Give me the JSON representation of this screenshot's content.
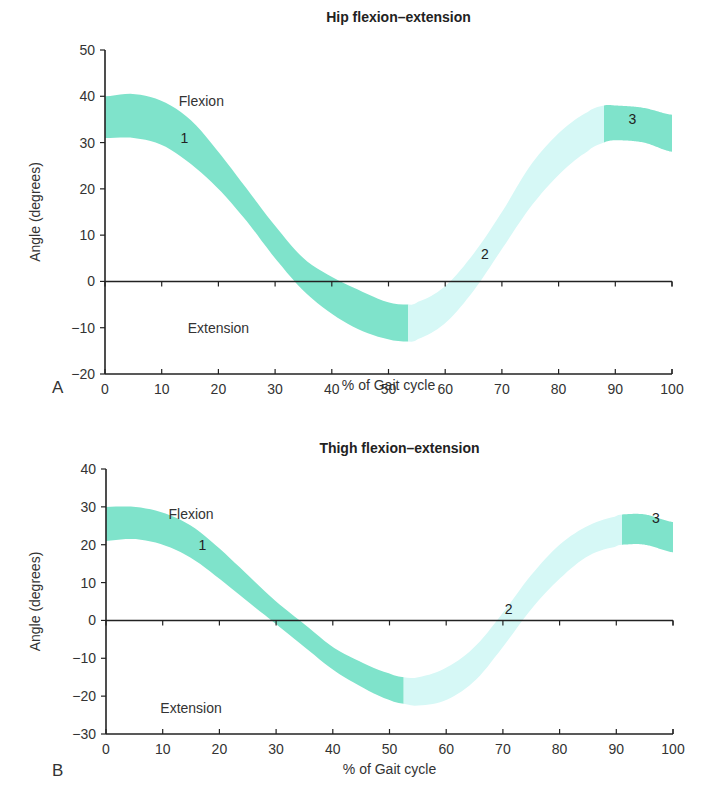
{
  "chart_data": [
    {
      "panel": "A",
      "type": "area",
      "title": "Hip flexion–extension",
      "xlabel": "% of Gait cycle",
      "ylabel": "Angle (degrees)",
      "xlim": [
        0,
        100
      ],
      "ylim": [
        -20,
        50
      ],
      "xticks": [
        0,
        10,
        20,
        30,
        40,
        50,
        60,
        70,
        80,
        90,
        100
      ],
      "yticks": [
        -20,
        -10,
        0,
        10,
        20,
        30,
        40,
        50
      ],
      "annotations": [
        {
          "text": "Flexion",
          "x": 17,
          "y": 39
        },
        {
          "text": "Extension",
          "x": 20,
          "y": -10
        },
        {
          "text": "1",
          "x": 14,
          "y": 31
        },
        {
          "text": "2",
          "x": 67,
          "y": 6
        },
        {
          "text": "3",
          "x": 93,
          "y": 35
        }
      ],
      "series": [
        {
          "name": "upper bound",
          "x": [
            0,
            5,
            10,
            15,
            20,
            25,
            30,
            35,
            40,
            45,
            50,
            53.5,
            55,
            60,
            65,
            70,
            75,
            80,
            85,
            88,
            90,
            95,
            100
          ],
          "values": [
            40,
            40.5,
            39,
            35,
            28,
            20,
            12,
            5,
            1,
            -2,
            -4.5,
            -5,
            -4.5,
            -1,
            6,
            15,
            25,
            32,
            36.5,
            38,
            38,
            37.5,
            36
          ]
        },
        {
          "name": "lower bound",
          "x": [
            0,
            5,
            10,
            15,
            20,
            25,
            30,
            35,
            40,
            45,
            50,
            53.5,
            55,
            60,
            65,
            70,
            75,
            80,
            85,
            88,
            90,
            95,
            100
          ],
          "values": [
            31,
            31,
            29.5,
            25.5,
            20,
            13,
            5,
            -2,
            -7,
            -10.5,
            -12.5,
            -13,
            -12.5,
            -9,
            -2,
            7,
            16,
            23,
            28,
            30,
            30.5,
            30,
            28
          ]
        }
      ],
      "segments": [
        {
          "label": "1",
          "from": 0,
          "to": 53.5,
          "color": "#7fe3cb"
        },
        {
          "label": "2",
          "from": 53.5,
          "to": 88,
          "color": "#d6f8f6"
        },
        {
          "label": "3",
          "from": 88,
          "to": 100,
          "color": "#7fe3cb"
        }
      ]
    },
    {
      "panel": "B",
      "type": "area",
      "title": "Thigh flexion–extension",
      "xlabel": "% of Gait cycle",
      "ylabel": "Angle (degrees)",
      "xlim": [
        0,
        100
      ],
      "ylim": [
        -30,
        40
      ],
      "xticks": [
        0,
        10,
        20,
        30,
        40,
        50,
        60,
        70,
        80,
        90,
        100
      ],
      "yticks": [
        -30,
        -20,
        -10,
        0,
        10,
        20,
        30,
        40
      ],
      "annotations": [
        {
          "text": "Flexion",
          "x": 15,
          "y": 28
        },
        {
          "text": "Extension",
          "x": 15,
          "y": -23
        },
        {
          "text": "1",
          "x": 17,
          "y": 20
        },
        {
          "text": "2",
          "x": 71,
          "y": 3
        },
        {
          "text": "3",
          "x": 97,
          "y": 27
        }
      ],
      "series": [
        {
          "name": "upper bound",
          "x": [
            0,
            5,
            10,
            15,
            20,
            25,
            30,
            35,
            40,
            45,
            50,
            52.5,
            55,
            60,
            65,
            70,
            75,
            80,
            85,
            90,
            91,
            95,
            100
          ],
          "values": [
            30,
            30,
            28.5,
            25,
            19,
            12,
            5,
            -1,
            -7,
            -11,
            -14,
            -15,
            -15,
            -12.5,
            -7,
            2,
            12,
            20,
            25,
            27.5,
            28,
            28,
            26
          ]
        },
        {
          "name": "lower bound",
          "x": [
            0,
            5,
            10,
            15,
            20,
            25,
            30,
            35,
            40,
            45,
            50,
            52.5,
            55,
            60,
            65,
            70,
            75,
            80,
            85,
            90,
            91,
            95,
            100
          ],
          "values": [
            21,
            21.5,
            20,
            16.5,
            11,
            5,
            -1,
            -7,
            -13,
            -17.5,
            -21,
            -22,
            -22.5,
            -21,
            -16,
            -7,
            3,
            11,
            17,
            19.5,
            20,
            20,
            18
          ]
        }
      ],
      "segments": [
        {
          "label": "1",
          "from": 0,
          "to": 52.5,
          "color": "#7fe3cb"
        },
        {
          "label": "2",
          "from": 52.5,
          "to": 91,
          "color": "#d6f8f6"
        },
        {
          "label": "3",
          "from": 91,
          "to": 100,
          "color": "#7fe3cb"
        }
      ]
    }
  ],
  "figure": {
    "panel_a_label": "A",
    "panel_b_label": "B",
    "colors": {
      "band_dark": "#7fe3cb",
      "band_light": "#d6f8f6",
      "axis": "#222222"
    }
  }
}
